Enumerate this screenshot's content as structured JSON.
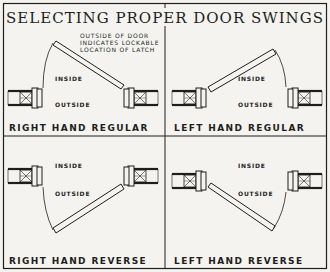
{
  "title": "SELECTING PROPER DOOR SWINGS",
  "note": {
    "line1": "OUTSIDE OF DOOR",
    "line2": "INDICATES LOCKABLE",
    "line3": "LOCATION OF LATCH"
  },
  "panels": [
    {
      "caption": "RIGHT HAND REGULAR",
      "inside": "INSIDE",
      "outside": "OUTSIDE"
    },
    {
      "caption": "LEFT HAND REGULAR",
      "inside": "INSIDE",
      "outside": "OUTSIDE"
    },
    {
      "caption": "RIGHT HAND REVERSE",
      "inside": "INSIDE",
      "outside": "OUTSIDE"
    },
    {
      "caption": "LEFT HAND REVERSE",
      "inside": "INSIDE",
      "outside": "OUTSIDE"
    }
  ],
  "colors": {
    "ink": "#1e1e1e",
    "paper": "#f4f3ef"
  }
}
